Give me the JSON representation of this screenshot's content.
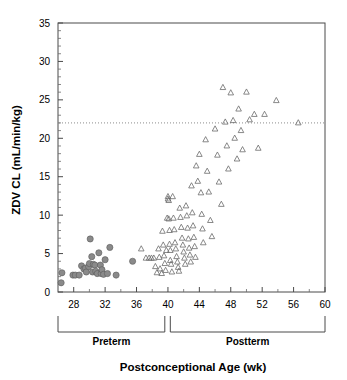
{
  "chart_data": {
    "type": "scatter",
    "title": "",
    "xlabel": "Postconceptional Age (wk)",
    "ylabel": "ZDV CL (mL/min/kg)",
    "xlim": [
      26,
      60
    ],
    "ylim": [
      0,
      35
    ],
    "x_major_ticks": [
      28,
      32,
      36,
      40,
      44,
      48,
      52,
      56,
      60
    ],
    "x_major_tick_labels": [
      "28",
      "32",
      "36",
      "40",
      "44",
      "48",
      "52",
      "56",
      "60"
    ],
    "x_minor_tick_step": 2,
    "y_major_ticks": [
      0,
      5,
      10,
      15,
      20,
      25,
      30,
      35
    ],
    "y_major_tick_labels": [
      "0",
      "5",
      "10",
      "15",
      "20",
      "25",
      "30",
      "35"
    ],
    "y_minor_tick_step": 1,
    "grid": false,
    "legend": "none",
    "annotations": [
      {
        "name": "reference-line",
        "type": "hline",
        "y": 22,
        "style": "dotted",
        "label": ""
      }
    ],
    "group_brackets": [
      {
        "label": "Preterm",
        "x_start": 26,
        "x_end": 39.6
      },
      {
        "label": "Postterm",
        "x_start": 40.3,
        "x_end": 60
      }
    ],
    "series": [
      {
        "name": "Preterm",
        "marker": "filled-circle",
        "color": "#8a8a8a",
        "points": [
          [
            26.4,
            1.2
          ],
          [
            26.5,
            2.5
          ],
          [
            27.9,
            2.2
          ],
          [
            28.2,
            2.2
          ],
          [
            28.7,
            2.2
          ],
          [
            29.0,
            3.4
          ],
          [
            29.3,
            3.0
          ],
          [
            29.5,
            3.1
          ],
          [
            29.6,
            2.6
          ],
          [
            29.9,
            3.3
          ],
          [
            30.0,
            3.7
          ],
          [
            30.1,
            6.9
          ],
          [
            30.3,
            4.6
          ],
          [
            30.4,
            2.6
          ],
          [
            30.5,
            3.6
          ],
          [
            30.7,
            3.5
          ],
          [
            30.8,
            2.7
          ],
          [
            31.0,
            2.4
          ],
          [
            31.2,
            5.1
          ],
          [
            31.4,
            3.5
          ],
          [
            31.5,
            2.4
          ],
          [
            31.6,
            2.9
          ],
          [
            31.8,
            2.3
          ],
          [
            32.0,
            4.2
          ],
          [
            32.3,
            2.4
          ],
          [
            32.6,
            5.8
          ],
          [
            33.4,
            2.2
          ],
          [
            35.5,
            4.0
          ]
        ]
      },
      {
        "name": "Postterm",
        "marker": "open-triangle",
        "color": "#6b6b6b",
        "points": [
          [
            36.6,
            5.6
          ],
          [
            37.2,
            4.4
          ],
          [
            37.6,
            4.4
          ],
          [
            37.9,
            4.4
          ],
          [
            38.2,
            4.4
          ],
          [
            38.4,
            3.3
          ],
          [
            38.6,
            2.5
          ],
          [
            38.8,
            5.6
          ],
          [
            38.9,
            4.5
          ],
          [
            39.0,
            3.0
          ],
          [
            39.2,
            2.4
          ],
          [
            39.3,
            7.9
          ],
          [
            39.4,
            6.1
          ],
          [
            39.5,
            4.7
          ],
          [
            39.6,
            3.7
          ],
          [
            39.7,
            2.8
          ],
          [
            39.8,
            5.4
          ],
          [
            39.9,
            9.6
          ],
          [
            40.0,
            12.4
          ],
          [
            40.0,
            12.1
          ],
          [
            40.1,
            11.9
          ],
          [
            40.1,
            9.5
          ],
          [
            40.2,
            8.0
          ],
          [
            40.2,
            6.2
          ],
          [
            40.3,
            5.4
          ],
          [
            40.3,
            4.1
          ],
          [
            40.4,
            3.6
          ],
          [
            40.5,
            2.6
          ],
          [
            40.6,
            12.4
          ],
          [
            40.7,
            9.6
          ],
          [
            40.8,
            8.1
          ],
          [
            40.9,
            6.4
          ],
          [
            41.0,
            5.6
          ],
          [
            41.1,
            4.6
          ],
          [
            41.2,
            3.9
          ],
          [
            41.3,
            3.2
          ],
          [
            41.4,
            2.7
          ],
          [
            41.5,
            10.9
          ],
          [
            41.6,
            9.7
          ],
          [
            41.7,
            8.4
          ],
          [
            41.8,
            7.0
          ],
          [
            41.9,
            6.1
          ],
          [
            42.0,
            5.2
          ],
          [
            42.1,
            4.4
          ],
          [
            42.2,
            3.6
          ],
          [
            42.3,
            11.2
          ],
          [
            42.4,
            9.9
          ],
          [
            42.5,
            8.3
          ],
          [
            42.6,
            6.9
          ],
          [
            42.7,
            5.7
          ],
          [
            42.8,
            4.8
          ],
          [
            42.9,
            3.9
          ],
          [
            43.0,
            13.8
          ],
          [
            43.1,
            10.3
          ],
          [
            43.2,
            8.6
          ],
          [
            43.3,
            7.1
          ],
          [
            43.4,
            5.9
          ],
          [
            43.5,
            4.5
          ],
          [
            43.6,
            16.4
          ],
          [
            43.8,
            14.4
          ],
          [
            44.0,
            17.9
          ],
          [
            44.2,
            12.9
          ],
          [
            44.3,
            10.1
          ],
          [
            44.4,
            8.2
          ],
          [
            44.5,
            6.4
          ],
          [
            44.8,
            19.8
          ],
          [
            45.0,
            15.7
          ],
          [
            45.2,
            13.0
          ],
          [
            45.4,
            9.3
          ],
          [
            45.6,
            7.2
          ],
          [
            46.0,
            21.2
          ],
          [
            46.3,
            17.8
          ],
          [
            46.5,
            14.3
          ],
          [
            46.8,
            11.4
          ],
          [
            47.0,
            26.6
          ],
          [
            47.3,
            22.1
          ],
          [
            47.5,
            19.0
          ],
          [
            47.7,
            16.0
          ],
          [
            48.0,
            25.9
          ],
          [
            48.3,
            22.3
          ],
          [
            48.5,
            20.0
          ],
          [
            48.8,
            17.3
          ],
          [
            49.0,
            23.8
          ],
          [
            49.3,
            21.0
          ],
          [
            49.5,
            18.5
          ],
          [
            50.0,
            26.0
          ],
          [
            50.4,
            22.4
          ],
          [
            51.0,
            23.1
          ],
          [
            51.5,
            18.7
          ],
          [
            52.3,
            23.1
          ],
          [
            53.8,
            24.9
          ],
          [
            56.6,
            22.0
          ]
        ]
      }
    ]
  }
}
